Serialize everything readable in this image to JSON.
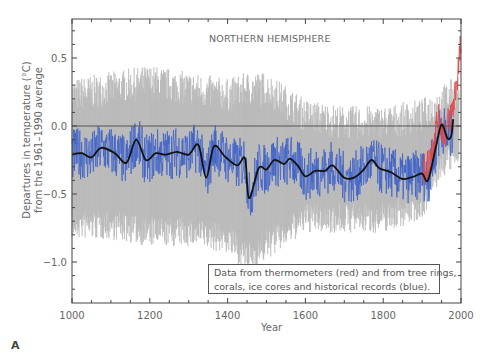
{
  "chart_data": {
    "type": "line",
    "title": "NORTHERN HEMISPHERE",
    "xlabel": "Year",
    "ylabel_lines": [
      "Departures in temperature (°C)",
      "from the 1961–1990 average"
    ],
    "xlim": [
      1000,
      2000
    ],
    "ylim": [
      -1.3,
      0.8
    ],
    "xticks": [
      1000,
      1200,
      1400,
      1600,
      1800,
      2000
    ],
    "xtick_labels": [
      "1000",
      "1200",
      "1400",
      "1600",
      "1800",
      "2000"
    ],
    "yticks": [
      0.5,
      0.0,
      -0.5,
      -1.0
    ],
    "ytick_labels": [
      "0.5",
      "0.0",
      "−0.5",
      "−1.0"
    ],
    "reference_line": 0.0,
    "annotation": [
      "Data from thermometers (red) and from tree rings,",
      "corals, ice cores and historical records (blue)."
    ],
    "panel_label": "A",
    "series": [
      {
        "name": "Smoothed reconstruction (50-yr)",
        "color": "#111111",
        "x": [
          1000,
          1025,
          1050,
          1075,
          1110,
          1140,
          1165,
          1190,
          1215,
          1240,
          1270,
          1300,
          1325,
          1345,
          1365,
          1395,
          1425,
          1445,
          1455,
          1480,
          1500,
          1520,
          1545,
          1560,
          1580,
          1600,
          1625,
          1650,
          1670,
          1700,
          1725,
          1750,
          1770,
          1790,
          1820,
          1850,
          1880,
          1900,
          1915,
          1935,
          1950,
          1965,
          1975,
          1980
        ],
        "values": [
          -0.21,
          -0.2,
          -0.23,
          -0.16,
          -0.2,
          -0.27,
          -0.1,
          -0.25,
          -0.2,
          -0.21,
          -0.19,
          -0.21,
          -0.14,
          -0.38,
          -0.15,
          -0.23,
          -0.29,
          -0.24,
          -0.53,
          -0.31,
          -0.32,
          -0.25,
          -0.28,
          -0.24,
          -0.29,
          -0.37,
          -0.33,
          -0.33,
          -0.29,
          -0.38,
          -0.38,
          -0.32,
          -0.25,
          -0.31,
          -0.34,
          -0.39,
          -0.37,
          -0.35,
          -0.4,
          -0.16,
          0.01,
          -0.09,
          -0.07,
          0.05
        ]
      },
      {
        "name": "Proxy records (tree rings, corals, ice cores, historical) — annual",
        "color": "#3a5fc8",
        "x": [
          1000,
          1980
        ],
        "range_note": "Annual values fluctuating roughly ±0.2 °C around the smoothed line"
      },
      {
        "name": "Thermometer records",
        "color": "#e04a4a",
        "x": [
          1902,
          1920,
          1940,
          1960,
          1980,
          1990,
          2000
        ],
        "values": [
          -0.35,
          -0.25,
          0.05,
          -0.05,
          0.15,
          0.35,
          0.6
        ]
      },
      {
        "name": "Uncertainty range (95%)",
        "color": "#b8b8b8",
        "type": "area",
        "x": [
          1000,
          1100,
          1200,
          1300,
          1400,
          1450,
          1500,
          1600,
          1700,
          1800,
          1900,
          1950,
          2000
        ],
        "upper": [
          0.25,
          0.3,
          0.35,
          0.3,
          0.25,
          0.3,
          0.3,
          0.1,
          0.05,
          0.05,
          0.1,
          0.2,
          0.3
        ],
        "lower": [
          -0.75,
          -0.75,
          -0.8,
          -0.8,
          -0.85,
          -1.0,
          -0.9,
          -0.7,
          -0.7,
          -0.7,
          -0.6,
          -0.3,
          -0.2
        ]
      }
    ]
  }
}
